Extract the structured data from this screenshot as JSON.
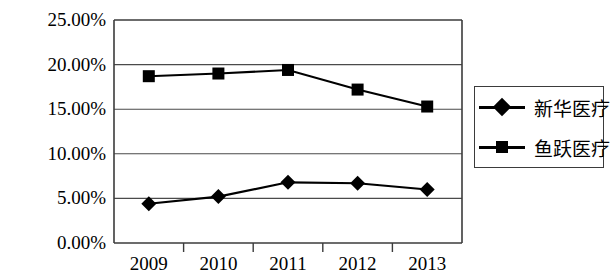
{
  "chart_data": {
    "type": "line",
    "title": "",
    "xlabel": "",
    "ylabel": "",
    "categories": [
      "2009",
      "2010",
      "2011",
      "2012",
      "2013"
    ],
    "ylim": [
      0,
      25
    ],
    "ytick_labels": [
      "0.00%",
      "5.00%",
      "10.00%",
      "15.00%",
      "20.00%",
      "25.00%"
    ],
    "ytick_values": [
      0,
      5,
      10,
      15,
      20,
      25
    ],
    "grid": true,
    "grid_axis": "y",
    "legend_position": "right",
    "series": [
      {
        "name": "新华医疗",
        "marker": "diamond",
        "values": [
          4.4,
          5.2,
          6.8,
          6.7,
          6.0
        ]
      },
      {
        "name": "鱼跃医疗",
        "marker": "square",
        "values": [
          18.7,
          19.0,
          19.4,
          17.2,
          15.3
        ]
      }
    ]
  },
  "colors": {
    "line": "#000000",
    "marker": "#000000",
    "grid": "#4a4a4a",
    "frame": "#3b3b3b",
    "background": "#ffffff"
  }
}
